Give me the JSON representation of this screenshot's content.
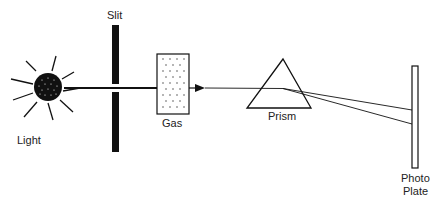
{
  "diagram": {
    "labels": {
      "light": "Light",
      "slit": "Slit",
      "gas": "Gas",
      "prism": "Prism",
      "photo_plate_line1": "Photo",
      "photo_plate_line2": "Plate"
    },
    "components": [
      "light-source",
      "slit",
      "gas-cell",
      "prism",
      "photo-plate"
    ],
    "colors": {
      "stroke": "#111111",
      "text": "#222222",
      "background": "#ffffff"
    }
  }
}
